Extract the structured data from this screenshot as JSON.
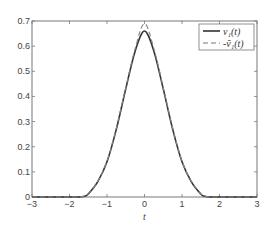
{
  "chart_data": {
    "type": "line",
    "title": "",
    "xlabel": "t",
    "ylabel": "",
    "xlim": [
      -3,
      3
    ],
    "ylim": [
      0,
      0.7
    ],
    "grid": false,
    "legend_position": "upper right",
    "x_ticks": [
      "-3",
      "-2",
      "-1",
      "0",
      "1",
      "2",
      "3"
    ],
    "y_ticks": [
      "0",
      "0.1",
      "0.2",
      "0.3",
      "0.4",
      "0.5",
      "0.6",
      "0.7"
    ],
    "legend": [
      "v₁(t)",
      "-ṽ₁(t)"
    ],
    "x": [
      -3,
      -2.5,
      -2,
      -1.75,
      -1.6,
      -1.5,
      -1.25,
      -1,
      -0.75,
      -0.5,
      -0.25,
      0,
      0.25,
      0.5,
      0.75,
      1,
      1.25,
      1.5,
      1.6,
      1.75,
      2,
      2.5,
      3
    ],
    "series": [
      {
        "name": "v₁(t)",
        "style": "solid",
        "values": [
          0,
          0,
          0,
          0,
          0.003,
          0.012,
          0.06,
          0.14,
          0.27,
          0.43,
          0.58,
          0.66,
          0.58,
          0.43,
          0.27,
          0.14,
          0.06,
          0.012,
          0.003,
          0,
          0,
          0,
          0
        ]
      },
      {
        "name": "-ṽ₁(t)",
        "style": "dashed",
        "values": [
          0,
          0,
          0,
          0,
          0.004,
          0.013,
          0.062,
          0.143,
          0.275,
          0.435,
          0.59,
          0.69,
          0.59,
          0.435,
          0.275,
          0.143,
          0.062,
          0.013,
          0.004,
          0,
          0,
          0,
          0
        ]
      }
    ]
  }
}
